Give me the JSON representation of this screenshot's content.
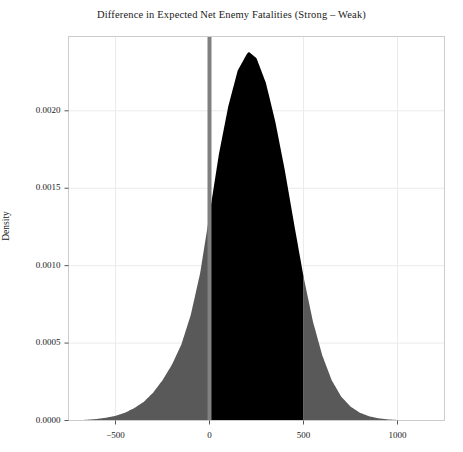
{
  "chart_data": {
    "type": "area",
    "title": "Difference in Expected Net Enemy Fatalities (Strong – Weak)",
    "xlabel": "",
    "ylabel": "Density",
    "xlim": [
      -750,
      1250
    ],
    "ylim": [
      0,
      0.00248
    ],
    "xticks": [
      -500,
      0,
      500,
      1000
    ],
    "xticklabels": [
      "−500",
      "0",
      "500",
      "1000"
    ],
    "yticks": [
      0.0,
      0.0005,
      0.001,
      0.0015,
      0.002
    ],
    "yticklabels": [
      "0.0000",
      "0.0005",
      "0.0010",
      "0.0015",
      "0.0020"
    ],
    "grid": true,
    "legend": null,
    "fill_default_color": "#595959",
    "fill_highlight_color": "#000000",
    "highlight_interval": [
      0,
      500
    ],
    "reference_line": {
      "x": 0,
      "color": "#808080",
      "width": 4
    },
    "annotations": [],
    "x": [
      -750,
      -700,
      -650,
      -600,
      -550,
      -500,
      -450,
      -400,
      -350,
      -300,
      -250,
      -200,
      -150,
      -100,
      -50,
      0,
      50,
      100,
      150,
      200,
      210,
      250,
      300,
      350,
      400,
      450,
      500,
      550,
      600,
      650,
      700,
      750,
      800,
      850,
      900,
      950,
      1000,
      1050,
      1100,
      1150,
      1200,
      1250
    ],
    "density": [
      0.0,
      2e-06,
      5e-06,
      1e-05,
      1.8e-05,
      3e-05,
      5e-05,
      8e-05,
      0.00012,
      0.00018,
      0.00026,
      0.00036,
      0.00049,
      0.00068,
      0.00095,
      0.00133,
      0.00172,
      0.00203,
      0.00226,
      0.00237,
      0.00238,
      0.00234,
      0.00218,
      0.00193,
      0.00162,
      0.00127,
      0.00093,
      0.00064,
      0.00042,
      0.00026,
      0.000155,
      9e-05,
      5e-05,
      2.7e-05,
      1.4e-05,
      7e-06,
      3.5e-06,
      1.6e-06,
      7e-07,
      3e-07,
      1e-07,
      0.0
    ]
  },
  "axes": {
    "frame_color": "#cccccc",
    "grid_color": "#ebebeb",
    "tick_color": "#555555"
  }
}
